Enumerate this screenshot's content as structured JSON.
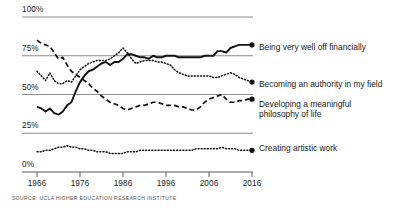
{
  "chart_data": {
    "type": "line",
    "title": "",
    "subtitle": "",
    "xlabel": "",
    "ylabel": "",
    "xlim": [
      1966,
      2016
    ],
    "ylim": [
      0,
      100
    ],
    "grid": true,
    "legend_position": "right-inline-endpoint",
    "source": "SOURCE: UCLA HIGHER EDUCATION RESEARCH INSTITUTE",
    "yticks": [
      "0%",
      "25%",
      "50%",
      "75%",
      "100%"
    ],
    "ytick_values": [
      0,
      25,
      50,
      75,
      100
    ],
    "xticks": [
      "1966",
      "1976",
      "1986",
      "1996",
      "2006",
      "2016"
    ],
    "xtick_values": [
      1966,
      1976,
      1986,
      1996,
      2006,
      2016
    ],
    "series": [
      {
        "name": "Being very well off financially",
        "style": "solid",
        "color": "#111111",
        "x": [
          1966,
          1967,
          1968,
          1969,
          1970,
          1971,
          1972,
          1973,
          1974,
          1975,
          1976,
          1977,
          1978,
          1979,
          1980,
          1981,
          1982,
          1983,
          1984,
          1985,
          1986,
          1987,
          1988,
          1989,
          1990,
          1991,
          1992,
          1993,
          1994,
          1995,
          1996,
          1997,
          1998,
          1999,
          2000,
          2001,
          2002,
          2003,
          2004,
          2005,
          2006,
          2007,
          2008,
          2009,
          2010,
          2011,
          2012,
          2013,
          2014,
          2015,
          2016
        ],
        "values": [
          42,
          41,
          39,
          41,
          38,
          37,
          39,
          43,
          45,
          52,
          58,
          62,
          65,
          66,
          68,
          70,
          71,
          69,
          71,
          71,
          73,
          76,
          76,
          75,
          74,
          74,
          73,
          75,
          74,
          74,
          75,
          75,
          75,
          74,
          74,
          74,
          74,
          74,
          74,
          75,
          75,
          75,
          78,
          78,
          77,
          80,
          81,
          82,
          82,
          82,
          82
        ]
      },
      {
        "name": "Becoming an authority in my field",
        "style": "dotted",
        "color": "#111111",
        "x": [
          1966,
          1967,
          1968,
          1969,
          1970,
          1971,
          1972,
          1973,
          1974,
          1975,
          1976,
          1977,
          1978,
          1979,
          1980,
          1981,
          1982,
          1983,
          1984,
          1985,
          1986,
          1987,
          1988,
          1989,
          1990,
          1991,
          1992,
          1993,
          1994,
          1995,
          1996,
          1997,
          1998,
          1999,
          2000,
          2001,
          2002,
          2003,
          2004,
          2005,
          2006,
          2007,
          2008,
          2009,
          2010,
          2011,
          2012,
          2013,
          2014,
          2015,
          2016
        ],
        "values": [
          65,
          62,
          59,
          64,
          59,
          57,
          57,
          59,
          58,
          62,
          66,
          68,
          70,
          71,
          72,
          72,
          72,
          73,
          75,
          77,
          80,
          77,
          73,
          70,
          71,
          72,
          72,
          72,
          71,
          71,
          70,
          69,
          66,
          64,
          63,
          62,
          62,
          62,
          62,
          62,
          62,
          61,
          61,
          62,
          63,
          64,
          63,
          61,
          60,
          59,
          58
        ]
      },
      {
        "name": "Developing a meaningful philosophy of life",
        "style": "dashed",
        "color": "#111111",
        "x": [
          1966,
          1967,
          1968,
          1969,
          1970,
          1971,
          1972,
          1973,
          1974,
          1975,
          1976,
          1977,
          1978,
          1979,
          1980,
          1981,
          1982,
          1983,
          1984,
          1985,
          1986,
          1987,
          1988,
          1989,
          1990,
          1991,
          1992,
          1993,
          1994,
          1995,
          1996,
          1997,
          1998,
          1999,
          2000,
          2001,
          2002,
          2003,
          2004,
          2005,
          2006,
          2007,
          2008,
          2009,
          2010,
          2011,
          2012,
          2013,
          2014,
          2015,
          2016
        ],
        "values": [
          85,
          83,
          82,
          81,
          77,
          73,
          74,
          69,
          65,
          63,
          61,
          59,
          57,
          54,
          52,
          49,
          47,
          45,
          44,
          43,
          41,
          40,
          41,
          42,
          43,
          43,
          44,
          45,
          45,
          44,
          43,
          43,
          43,
          42,
          42,
          41,
          40,
          40,
          42,
          45,
          47,
          48,
          49,
          50,
          47,
          45,
          45,
          46,
          46,
          47,
          47
        ]
      },
      {
        "name": "Creating artistic work",
        "style": "dotted",
        "color": "#111111",
        "x": [
          1966,
          1967,
          1968,
          1969,
          1970,
          1971,
          1972,
          1973,
          1974,
          1975,
          1976,
          1977,
          1978,
          1979,
          1980,
          1981,
          1982,
          1983,
          1984,
          1985,
          1986,
          1987,
          1988,
          1989,
          1990,
          1991,
          1992,
          1993,
          1994,
          1995,
          1996,
          1997,
          1998,
          1999,
          2000,
          2001,
          2002,
          2003,
          2004,
          2005,
          2006,
          2007,
          2008,
          2009,
          2010,
          2011,
          2012,
          2013,
          2014,
          2015,
          2016
        ],
        "values": [
          13,
          13,
          14,
          14,
          15,
          16,
          16,
          17,
          16,
          16,
          15,
          15,
          14,
          14,
          13,
          13,
          13,
          12,
          12,
          12,
          12,
          13,
          13,
          13,
          14,
          14,
          14,
          14,
          14,
          14,
          14,
          14,
          14,
          14,
          14,
          14,
          14,
          15,
          15,
          15,
          15,
          15,
          15,
          16,
          15,
          15,
          15,
          14,
          14,
          14,
          14
        ]
      }
    ]
  },
  "labels": {
    "series_0": "Being very well off financially",
    "series_1": "Becoming an authority in my field",
    "series_2_line1": "Developing a meaningful",
    "series_2_line2": "philosophy of life",
    "series_3": "Creating artistic work"
  },
  "colors": {
    "line": "#111111",
    "gridline": "#8c8c8c",
    "axis": "#5a5a5a",
    "text": "#1a1a1a",
    "source_text": "#555555"
  }
}
